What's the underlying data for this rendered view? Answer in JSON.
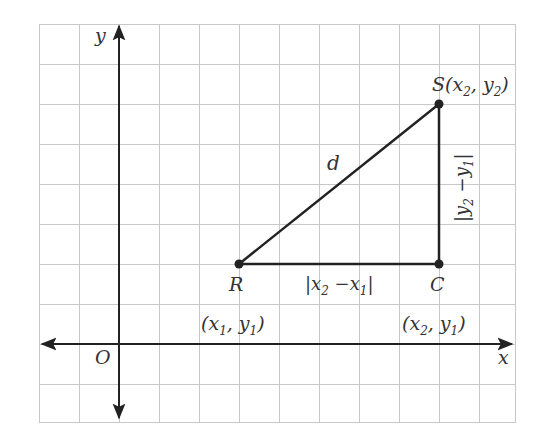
{
  "diagram": {
    "type": "coordinate-plane-distance",
    "colors": {
      "grid": "#c8c8c8",
      "axis": "#222222",
      "segment": "#222222",
      "point": "#222222",
      "text": "#333333"
    },
    "axes": {
      "x_label": "x",
      "y_label": "y",
      "origin_label": "O"
    },
    "points": {
      "R": {
        "name": "R",
        "coords": "(x1, y1)",
        "coord_parts": [
          "(x",
          "1",
          ", y",
          "1",
          ")"
        ]
      },
      "S": {
        "name": "S",
        "coords": "(x2, y2)",
        "coord_parts": [
          "(x",
          "2",
          ", y",
          "2",
          ")"
        ]
      },
      "C": {
        "name": "C",
        "coords": "(x2, y1)",
        "coord_parts": [
          "(x",
          "2",
          ", y",
          "1",
          ")"
        ]
      }
    },
    "segments": {
      "hypotenuse": {
        "label": "d"
      },
      "horizontal": {
        "label": "|x2 −x1|",
        "parts": [
          "|x",
          "2",
          " −x",
          "1",
          "|"
        ]
      },
      "vertical": {
        "label": "|y2 −y1|",
        "parts": [
          "|y",
          "2",
          " −y",
          "1",
          "|"
        ]
      }
    }
  }
}
